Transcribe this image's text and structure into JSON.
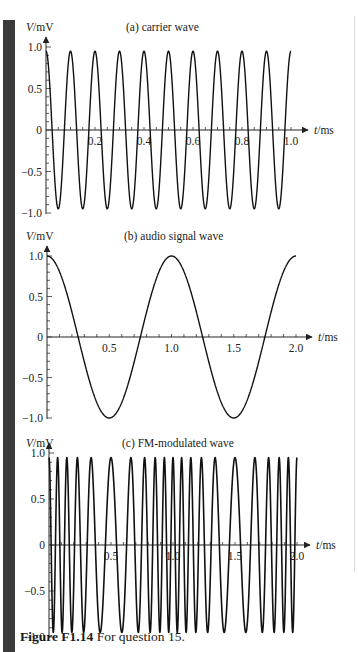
{
  "figure": {
    "label": "Figure F1.14",
    "text": " For question 15."
  },
  "colors": {
    "line": "#111111",
    "axis": "#222222",
    "margin_bar": "#3b3b3b"
  },
  "chart_data": [
    {
      "type": "line",
      "title": "(a) carrier wave",
      "ylabel": "V/mV",
      "xlabel": "t/ms",
      "xlim": [
        0,
        1.0
      ],
      "ylim": [
        -1.0,
        1.0
      ],
      "xticks": [
        0.2,
        0.4,
        0.6,
        0.8,
        1.0
      ],
      "xtick_labels": [
        "0.2",
        "0.4",
        "0.6",
        "0.8",
        "1.0"
      ],
      "yticks": [
        1.0,
        0.5,
        0,
        -0.5,
        -1.0
      ],
      "ytick_labels": [
        "1.0",
        "0.5",
        "0",
        "−0.5",
        "−1.0"
      ],
      "grid": false,
      "series": [
        {
          "name": "carrier",
          "function": "V = cos(2π f t)",
          "amplitude_mV": 1.0,
          "frequency_kHz": 10,
          "period_ms": 0.1,
          "x": [
            0,
            0.05,
            0.1,
            0.15,
            0.2,
            0.25,
            0.3,
            0.35,
            0.4,
            0.45,
            0.5,
            0.55,
            0.6,
            0.65,
            0.7,
            0.75,
            0.8,
            0.85,
            0.9,
            0.95,
            1.0
          ],
          "values": [
            1,
            -1,
            1,
            -1,
            1,
            -1,
            1,
            -1,
            1,
            -1,
            1,
            -1,
            1,
            -1,
            1,
            -1,
            1,
            -1,
            1,
            -1,
            1
          ]
        }
      ]
    },
    {
      "type": "line",
      "title": "(b) audio signal wave",
      "ylabel": "V/mV",
      "xlabel": "t/ms",
      "xlim": [
        0,
        2.0
      ],
      "ylim": [
        -1.0,
        1.0
      ],
      "xticks": [
        0.5,
        1.0,
        1.5,
        2.0
      ],
      "xtick_labels": [
        "0.5",
        "1.0",
        "1.5",
        "2.0"
      ],
      "yticks": [
        1.0,
        0.5,
        0,
        -0.5,
        -1.0
      ],
      "ytick_labels": [
        "1.0",
        "0.5",
        "0",
        "−0.5",
        "−1.0"
      ],
      "grid": false,
      "series": [
        {
          "name": "audio",
          "function": "V = cos(2π f t)",
          "amplitude_mV": 1.0,
          "frequency_kHz": 1,
          "period_ms": 1.0,
          "x": [
            0,
            0.25,
            0.5,
            0.75,
            1.0,
            1.25,
            1.5,
            1.75,
            2.0
          ],
          "values": [
            1,
            0,
            -1,
            0,
            1,
            0,
            -1,
            0,
            1
          ]
        }
      ]
    },
    {
      "type": "line",
      "title": "(c) FM-modulated wave",
      "ylabel": "V/mV",
      "xlabel": "t/ms",
      "xlim": [
        0,
        2.0
      ],
      "ylim": [
        -1.0,
        1.0
      ],
      "xticks": [
        0.5,
        1.0,
        1.5,
        2.0
      ],
      "xtick_labels": [
        "0.5",
        "1.0",
        "1.5",
        "2.0"
      ],
      "yticks": [
        1.0,
        0.5,
        0,
        -0.5,
        -1.0
      ],
      "ytick_labels": [
        "1.0",
        "0.5",
        "0",
        "−0.5",
        "−1.0"
      ],
      "grid": false,
      "series": [
        {
          "name": "FM wave",
          "amplitude_mV": 1.0,
          "carrier_frequency_kHz": 10,
          "modulating_frequency_kHz": 1,
          "frequency_deviation_kHz": 4.5,
          "description": "frequency highest near t = 0, 1.0, 2.0 ms and lowest near t = 0.5, 1.5 ms",
          "peak_times_ms": [
            0,
            0.065,
            0.137,
            0.218,
            0.323,
            0.5,
            0.677,
            0.782,
            0.863,
            0.935,
            1.0,
            1.065,
            1.137,
            1.218,
            1.323,
            1.5,
            1.677,
            1.782,
            1.863,
            1.935,
            2.0
          ]
        }
      ]
    }
  ]
}
